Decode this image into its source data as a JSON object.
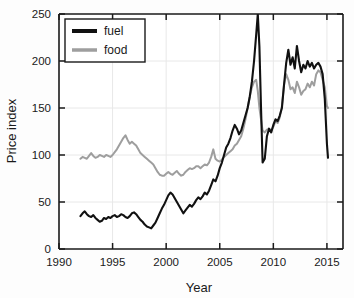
{
  "chart_data": {
    "type": "line",
    "title": "",
    "xlabel": "Year",
    "ylabel": "Price index",
    "xlim": [
      1990,
      2016.5
    ],
    "ylim": [
      0,
      250
    ],
    "xticks": [
      1990,
      1995,
      2000,
      2005,
      2010,
      2015
    ],
    "yticks": [
      0,
      50,
      100,
      150,
      200,
      250
    ],
    "grid": true,
    "legend_position": "upper left",
    "legend_entries": [
      "fuel",
      "food"
    ],
    "colors": {
      "fuel": "#111111",
      "food": "#9e9e9e",
      "axis": "#1a1a1a",
      "grid": "#e8e8e8",
      "background": "#fdfdfd"
    },
    "series": [
      {
        "name": "fuel",
        "color": "#111111",
        "x": [
          1992.0,
          1992.2,
          1992.4,
          1992.6,
          1992.8,
          1993.0,
          1993.2,
          1993.4,
          1993.6,
          1993.8,
          1994.0,
          1994.2,
          1994.4,
          1994.6,
          1994.8,
          1995.0,
          1995.2,
          1995.4,
          1995.6,
          1995.8,
          1996.0,
          1996.2,
          1996.4,
          1996.6,
          1996.8,
          1997.0,
          1997.2,
          1997.4,
          1997.6,
          1997.8,
          1998.0,
          1998.2,
          1998.4,
          1998.6,
          1998.8,
          1999.0,
          1999.2,
          1999.4,
          1999.6,
          1999.8,
          2000.0,
          2000.2,
          2000.4,
          2000.6,
          2000.8,
          2001.0,
          2001.2,
          2001.4,
          2001.6,
          2001.8,
          2002.0,
          2002.2,
          2002.4,
          2002.6,
          2002.8,
          2003.0,
          2003.2,
          2003.4,
          2003.6,
          2003.8,
          2004.0,
          2004.2,
          2004.4,
          2004.6,
          2004.8,
          2005.0,
          2005.2,
          2005.4,
          2005.6,
          2005.8,
          2006.0,
          2006.2,
          2006.4,
          2006.6,
          2006.8,
          2007.0,
          2007.2,
          2007.4,
          2007.6,
          2007.8,
          2008.0,
          2008.2,
          2008.4,
          2008.55,
          2008.7,
          2008.85,
          2009.0,
          2009.2,
          2009.4,
          2009.6,
          2009.8,
          2010.0,
          2010.2,
          2010.4,
          2010.6,
          2010.8,
          2011.0,
          2011.2,
          2011.4,
          2011.6,
          2011.8,
          2012.0,
          2012.2,
          2012.4,
          2012.6,
          2012.8,
          2013.0,
          2013.2,
          2013.4,
          2013.6,
          2013.8,
          2014.0,
          2014.2,
          2014.4,
          2014.6,
          2014.8,
          2015.0,
          2015.1
        ],
        "y": [
          35,
          38,
          40,
          37,
          35,
          34,
          36,
          33,
          31,
          29,
          30,
          33,
          32,
          34,
          33,
          35,
          36,
          34,
          35,
          37,
          36,
          34,
          33,
          35,
          38,
          39,
          37,
          34,
          31,
          29,
          26,
          24,
          23,
          22,
          25,
          28,
          33,
          38,
          43,
          47,
          52,
          57,
          60,
          58,
          54,
          50,
          46,
          42,
          38,
          41,
          44,
          47,
          45,
          48,
          52,
          55,
          53,
          56,
          60,
          58,
          62,
          68,
          74,
          72,
          78,
          86,
          92,
          100,
          108,
          112,
          118,
          126,
          132,
          128,
          122,
          126,
          134,
          142,
          150,
          162,
          178,
          200,
          228,
          250,
          215,
          150,
          92,
          96,
          120,
          128,
          124,
          132,
          138,
          136,
          142,
          150,
          175,
          198,
          212,
          196,
          204,
          192,
          216,
          200,
          188,
          196,
          192,
          200,
          194,
          198,
          192,
          196,
          198,
          194,
          186,
          160,
          112,
          97
        ]
      },
      {
        "name": "food",
        "color": "#9e9e9e",
        "x": [
          1992.0,
          1992.2,
          1992.4,
          1992.6,
          1992.8,
          1993.0,
          1993.2,
          1993.4,
          1993.6,
          1993.8,
          1994.0,
          1994.2,
          1994.4,
          1994.6,
          1994.8,
          1995.0,
          1995.2,
          1995.4,
          1995.6,
          1995.8,
          1996.0,
          1996.2,
          1996.4,
          1996.6,
          1996.8,
          1997.0,
          1997.2,
          1997.4,
          1997.6,
          1997.8,
          1998.0,
          1998.2,
          1998.4,
          1998.6,
          1998.8,
          1999.0,
          1999.2,
          1999.4,
          1999.6,
          1999.8,
          2000.0,
          2000.2,
          2000.4,
          2000.6,
          2000.8,
          2001.0,
          2001.2,
          2001.4,
          2001.6,
          2001.8,
          2002.0,
          2002.2,
          2002.4,
          2002.6,
          2002.8,
          2003.0,
          2003.2,
          2003.4,
          2003.6,
          2003.8,
          2004.0,
          2004.2,
          2004.4,
          2004.6,
          2004.8,
          2005.0,
          2005.2,
          2005.4,
          2005.6,
          2005.8,
          2006.0,
          2006.2,
          2006.4,
          2006.6,
          2006.8,
          2007.0,
          2007.2,
          2007.4,
          2007.6,
          2007.8,
          2008.0,
          2008.2,
          2008.4,
          2008.55,
          2008.7,
          2008.85,
          2009.0,
          2009.2,
          2009.4,
          2009.6,
          2009.8,
          2010.0,
          2010.2,
          2010.4,
          2010.6,
          2010.8,
          2011.0,
          2011.2,
          2011.4,
          2011.6,
          2011.8,
          2012.0,
          2012.2,
          2012.4,
          2012.6,
          2012.8,
          2013.0,
          2013.2,
          2013.4,
          2013.6,
          2013.8,
          2014.0,
          2014.2,
          2014.4,
          2014.6,
          2014.8,
          2015.0,
          2015.1
        ],
        "y": [
          96,
          98,
          97,
          96,
          99,
          102,
          99,
          97,
          98,
          100,
          99,
          98,
          100,
          99,
          98,
          100,
          103,
          106,
          110,
          114,
          118,
          121,
          116,
          112,
          114,
          112,
          110,
          106,
          102,
          100,
          98,
          96,
          94,
          92,
          90,
          86,
          82,
          79,
          78,
          78,
          80,
          82,
          80,
          79,
          81,
          83,
          80,
          78,
          79,
          82,
          84,
          86,
          85,
          86,
          88,
          88,
          86,
          88,
          90,
          89,
          92,
          98,
          106,
          96,
          94,
          93,
          95,
          98,
          100,
          102,
          104,
          106,
          110,
          112,
          116,
          120,
          128,
          138,
          150,
          162,
          172,
          178,
          180,
          168,
          150,
          138,
          126,
          124,
          127,
          128,
          126,
          130,
          136,
          134,
          140,
          152,
          175,
          186,
          180,
          170,
          172,
          166,
          178,
          172,
          164,
          168,
          170,
          176,
          172,
          178,
          174,
          186,
          190,
          188,
          180,
          172,
          152,
          150
        ]
      }
    ]
  },
  "axes": {
    "y_title": "Price index",
    "x_title": "Year",
    "y_tick_labels": [
      "0",
      "50",
      "100",
      "150",
      "200",
      "250"
    ],
    "x_tick_labels": [
      "1990",
      "1995",
      "2000",
      "2005",
      "2010",
      "2015"
    ]
  },
  "legend": {
    "items": [
      {
        "label": "fuel",
        "color": "#111111",
        "swatch_width": 4
      },
      {
        "label": "food",
        "color": "#9e9e9e",
        "swatch_width": 3.5
      }
    ]
  }
}
